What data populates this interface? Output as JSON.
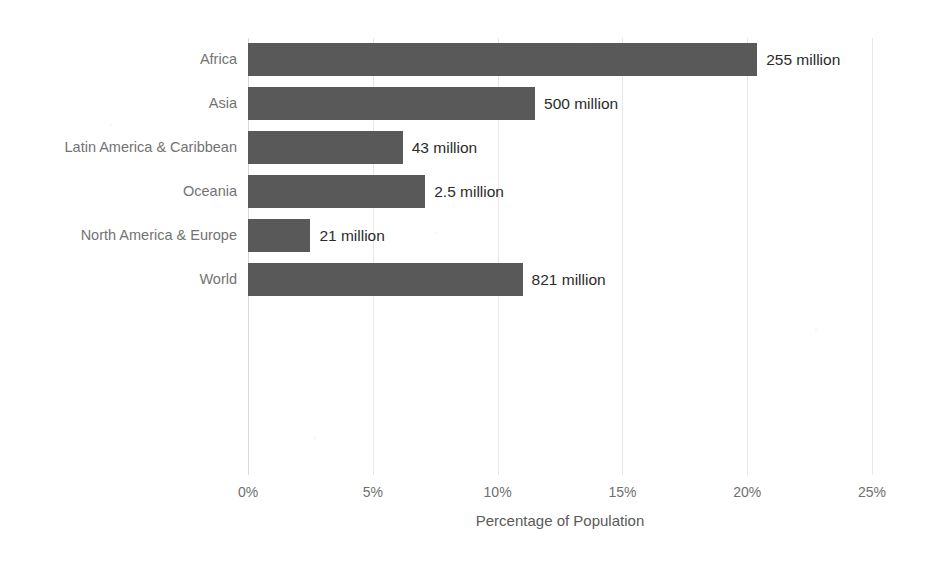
{
  "chart_data": {
    "type": "bar",
    "orientation": "horizontal",
    "title": "",
    "xlabel": "Percentage of Population",
    "ylabel": "",
    "xlim": [
      0,
      25
    ],
    "xticks": [
      "0%",
      "5%",
      "10%",
      "15%",
      "20%",
      "25%"
    ],
    "xtick_values": [
      0,
      5,
      10,
      15,
      20,
      25
    ],
    "grid": true,
    "legend": "none",
    "bar_color": "#595959",
    "label_color": "#737373",
    "value_color": "#2b2b2b",
    "categories": [
      "Africa",
      "Asia",
      "Latin America & Caribbean",
      "Oceania",
      "North America & Europe",
      "World"
    ],
    "values": [
      20.4,
      11.5,
      6.2,
      7.1,
      2.5,
      11.0
    ],
    "data_labels": [
      "255 million",
      "500 million",
      "43 million",
      "2.5 million",
      "21 million",
      "821 million"
    ],
    "series": [
      {
        "name": "Percentage of Population",
        "values": [
          20.4,
          11.5,
          6.2,
          7.1,
          2.5,
          11.0
        ]
      }
    ],
    "points": [
      {
        "category": "Africa",
        "value": 20.4,
        "data_label": "255 million"
      },
      {
        "category": "Asia",
        "value": 11.5,
        "data_label": "500 million"
      },
      {
        "category": "Latin America & Caribbean",
        "value": 6.2,
        "data_label": "43 million"
      },
      {
        "category": "Oceania",
        "value": 7.1,
        "data_label": "2.5 million"
      },
      {
        "category": "North America & Europe",
        "value": 2.5,
        "data_label": "21 million"
      },
      {
        "category": "World",
        "value": 11.0,
        "data_label": "821 million"
      }
    ]
  }
}
